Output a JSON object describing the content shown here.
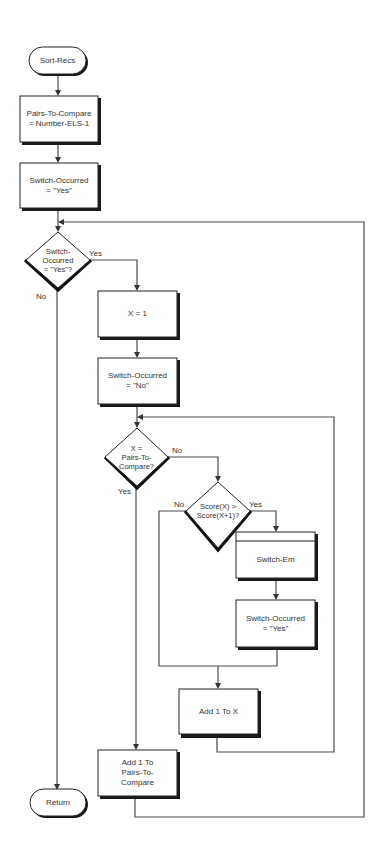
{
  "colors": {
    "line": "#4a4a4a",
    "box_border": "#222222",
    "shadow": "#1a1a1a",
    "text": "#333333",
    "background": "#ffffff"
  },
  "nodes": {
    "start": {
      "type": "terminal",
      "label": "Sort-Recs"
    },
    "init_pairs": {
      "type": "process",
      "label": "Pairs-To-Compare\n= Number-ELS-1"
    },
    "init_switch": {
      "type": "process",
      "label": "Switch-Occurred\n= \"Yes\""
    },
    "check_switch": {
      "type": "decision",
      "label": "Switch-\nOccurred\n= \"Yes\"?"
    },
    "set_x": {
      "type": "process",
      "label": "X = 1"
    },
    "reset_switch": {
      "type": "process",
      "label": "Switch-Occurred\n= \"No\""
    },
    "check_x": {
      "type": "decision",
      "label": "X =\nPairs-To-\nCompare?"
    },
    "compare_scores": {
      "type": "decision",
      "label": "Score(X) >\nScore(X+1)?"
    },
    "switch_em": {
      "type": "predefined-process",
      "label": "Switch-Em"
    },
    "set_switch_yes": {
      "type": "process",
      "label": "Switch-Occurred\n= \"Yes\""
    },
    "inc_x": {
      "type": "process",
      "label": "Add 1 To X"
    },
    "inc_pairs": {
      "type": "process",
      "label": "Add 1 To\nPairs-To-\nCompare"
    },
    "end": {
      "type": "terminal",
      "label": "Return"
    }
  },
  "edge_labels": {
    "check_switch_yes": "Yes",
    "check_switch_no": "No",
    "check_x_no": "No",
    "check_x_yes": "Yes",
    "compare_no": "No",
    "compare_yes": "Yes"
  }
}
